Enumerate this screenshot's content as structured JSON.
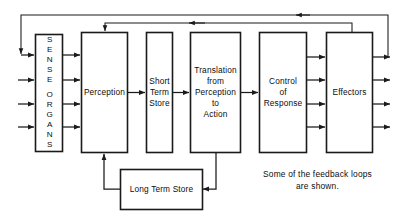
{
  "figure": {
    "caption": "Some  of  the  feedback  loops\nare shown.",
    "ink_color": "#1a1a1a",
    "background_color": "#ffffff"
  },
  "boxes": [
    {
      "id": "sense-organs",
      "label": "SENSE ORGANS",
      "orientation": "vertical",
      "letters_line1": "SENSE",
      "letters_line2": "ORGANS"
    },
    {
      "id": "perception",
      "label": "Perception",
      "orientation": "horizontal"
    },
    {
      "id": "short-term-store",
      "label": "Short\nTerm\nStore",
      "orientation": "horizontal"
    },
    {
      "id": "translation",
      "label": "Translation\nfrom\nPerception\nto\nAction",
      "orientation": "horizontal"
    },
    {
      "id": "control-of-response",
      "label": "Control\nof\nResponse",
      "orientation": "horizontal"
    },
    {
      "id": "effectors",
      "label": "Effectors",
      "orientation": "horizontal"
    },
    {
      "id": "long-term-store",
      "label": "Long Term Store",
      "orientation": "horizontal"
    }
  ],
  "connections": {
    "stimulus_inputs_count": 4,
    "sense_to_perception_count": 4,
    "control_to_effectors_count": 4,
    "effector_outputs_count": 4,
    "feedback_loops": [
      {
        "id": "outer-feedback-loop",
        "from": "effectors",
        "to": "sense-organs"
      },
      {
        "id": "inner-feedback-loop",
        "from": "effectors",
        "to": "perception"
      }
    ],
    "long_term_store_links": [
      {
        "id": "lts-to-perception",
        "from": "long-term-store",
        "to": "perception"
      },
      {
        "id": "translation-to-lts",
        "from": "translation",
        "to": "long-term-store"
      }
    ],
    "serial_chain": [
      "perception",
      "short-term-store",
      "translation",
      "control-of-response"
    ]
  }
}
